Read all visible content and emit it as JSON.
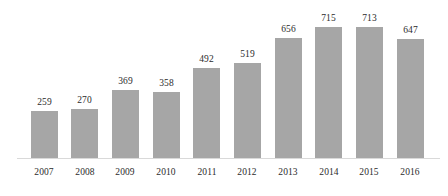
{
  "chart_data": {
    "type": "bar",
    "title": "",
    "subtitle": "",
    "xlabel": "",
    "ylabel": "",
    "categories": [
      "2007",
      "2008",
      "2009",
      "2010",
      "2011",
      "2012",
      "2013",
      "2014",
      "2015",
      "2016"
    ],
    "values": [
      259,
      270,
      369,
      358,
      492,
      519,
      656,
      715,
      713,
      647
    ],
    "data_labels": [
      "259",
      "270",
      "369",
      "358",
      "492",
      "519",
      "656",
      "715",
      "713",
      "647"
    ],
    "series": [
      {
        "name": "",
        "values": [
          259,
          270,
          369,
          358,
          492,
          519,
          656,
          715,
          713,
          647
        ]
      }
    ],
    "ylim": [
      0,
      715
    ],
    "grid": false,
    "y_axis_visible": false,
    "x_axis_visible": true,
    "legend": false,
    "legend_position": "none",
    "annotations": [],
    "colors": {
      "bar_fill": "#a6a6a6",
      "background": "#ffffff",
      "axis_line": "#d9d9d9",
      "text": "#2b2b2b"
    }
  }
}
